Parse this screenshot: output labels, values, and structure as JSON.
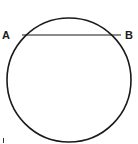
{
  "diagram": {
    "type": "circle-with-chord",
    "circle": {
      "cx": 69,
      "cy": 80,
      "r": 62
    },
    "chord": {
      "x1": 22,
      "y1": 35,
      "x2": 121,
      "y2": 35
    },
    "points": [
      {
        "label": "A",
        "x": 2,
        "y": 39
      },
      {
        "label": "B",
        "x": 125,
        "y": 39
      }
    ],
    "stroke_color": "#1a1a1a",
    "stray_mark": {
      "x": 3,
      "y": 140
    }
  }
}
